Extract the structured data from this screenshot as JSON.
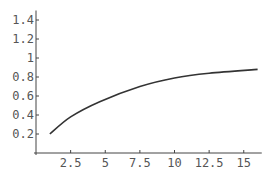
{
  "chart_data": {
    "type": "line",
    "title": "",
    "xlabel": "",
    "ylabel": "",
    "xlim": [
      0,
      16.3
    ],
    "ylim": [
      0,
      1.5
    ],
    "grid": false,
    "legend": null,
    "x_ticks": [
      2.5,
      5,
      7.5,
      10,
      12.5,
      15
    ],
    "x_tick_labels": [
      "2.5",
      "5",
      "7.5",
      "10",
      "12.5",
      "15"
    ],
    "y_ticks": [
      0.2,
      0.4,
      0.6,
      0.8,
      1,
      1.2,
      1.4
    ],
    "y_tick_labels": [
      "0.2",
      "0.4",
      "0.6",
      "0.8",
      "1",
      "1.2",
      "1.4"
    ],
    "series": [
      {
        "name": "curve",
        "color": "#333333",
        "x": [
          1,
          2.5,
          4.6,
          7.5,
          10,
          12.5,
          16
        ],
        "y": [
          0.2,
          0.38,
          0.54,
          0.7,
          0.79,
          0.84,
          0.88
        ]
      }
    ]
  }
}
